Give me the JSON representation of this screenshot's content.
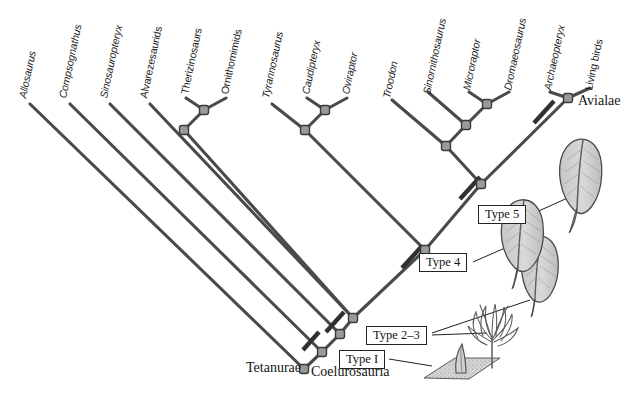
{
  "figure": {
    "type": "cladogram",
    "title_visible": false,
    "colors": {
      "branch": "#4a4a4a",
      "node_fill": "#8d8d8d",
      "node_stroke": "#3a3a3a",
      "tick": "#3a3a3a",
      "text": "#1b1b1b",
      "box_border": "#232323",
      "feather_fill": "#cfcfcf",
      "feather_stroke": "#4a4a4a",
      "ground_fill": "#c9c9c9"
    },
    "tips": [
      {
        "id": "allosaurus",
        "label": "Allosaurus",
        "italic": true,
        "x": 22,
        "y": 92
      },
      {
        "id": "compsognathus",
        "label": "Compsognathus",
        "italic": true,
        "x": 62,
        "y": 92
      },
      {
        "id": "sinosauropteryx",
        "label": "Sinosauropteryx",
        "italic": true,
        "x": 103,
        "y": 92
      },
      {
        "id": "alvarezsaurids",
        "label": "Alvarezesaurids",
        "italic": false,
        "x": 143,
        "y": 92
      },
      {
        "id": "therizinosaurs",
        "label": "Therizinosaurs",
        "italic": false,
        "x": 184,
        "y": 88
      },
      {
        "id": "ornithomimids",
        "label": "Ornithomimids",
        "italic": false,
        "x": 224,
        "y": 88
      },
      {
        "id": "tyrannosaurus",
        "label": "Tyrannosaurus",
        "italic": true,
        "x": 265,
        "y": 92
      },
      {
        "id": "caudipteryx",
        "label": "Caudipteryx",
        "italic": true,
        "x": 305,
        "y": 88
      },
      {
        "id": "oviraptor",
        "label": "Oviraptor",
        "italic": true,
        "x": 345,
        "y": 88
      },
      {
        "id": "troodon",
        "label": "Troodon",
        "italic": true,
        "x": 386,
        "y": 92
      },
      {
        "id": "sinornithosaurus",
        "label": "Sinornithosaurus",
        "italic": true,
        "x": 426,
        "y": 88
      },
      {
        "id": "microraptor",
        "label": "Microraptor",
        "italic": true,
        "x": 466,
        "y": 84
      },
      {
        "id": "dromaeosaurus",
        "label": "Dromaeosaurus",
        "italic": true,
        "x": 507,
        "y": 84
      },
      {
        "id": "archaeopteryx",
        "label": "Archaeopteryx",
        "italic": true,
        "x": 547,
        "y": 84
      },
      {
        "id": "living_birds",
        "label": "Living birds",
        "italic": false,
        "x": 588,
        "y": 84
      }
    ],
    "clade_labels": [
      {
        "id": "avialae",
        "label": "Avialae",
        "x": 560,
        "y": 100
      },
      {
        "id": "tetanurae",
        "label": "Tetanurae",
        "x": 246,
        "y": 364
      },
      {
        "id": "coelurosauria",
        "label": "Coelurosauria",
        "x": 311,
        "y": 368
      }
    ],
    "feather_callouts": [
      {
        "id": "type5",
        "label": "Type 5",
        "box_x": 478,
        "box_y": 205,
        "box_w": 54,
        "box_h": 19
      },
      {
        "id": "type4",
        "label": "Type 4",
        "box_x": 419,
        "box_y": 253,
        "box_w": 54,
        "box_h": 19
      },
      {
        "id": "type2_3",
        "label": "Type 2–3",
        "box_x": 366,
        "box_y": 327,
        "box_w": 66,
        "box_h": 19
      },
      {
        "id": "type1",
        "label": "Type I",
        "box_x": 339,
        "box_y": 350,
        "box_w": 50,
        "box_h": 19
      }
    ],
    "character_ticks": [
      {
        "id": "tick-type1",
        "x": 311,
        "y": 341
      },
      {
        "id": "tick-type2-3",
        "x": 335,
        "y": 322
      },
      {
        "id": "tick-type4",
        "x": 412,
        "y": 257
      },
      {
        "id": "tick-type5",
        "x": 470,
        "y": 188
      },
      {
        "id": "tick-avialae",
        "x": 544,
        "y": 112
      }
    ],
    "internal_nodes": [
      {
        "id": "node-ther-orni",
        "x": 204,
        "y": 110
      },
      {
        "id": "node-alv",
        "x": 184,
        "y": 130
      },
      {
        "id": "node-caud-ovi",
        "x": 325,
        "y": 110
      },
      {
        "id": "node-tyr",
        "x": 305,
        "y": 130
      },
      {
        "id": "node-micro-drom",
        "x": 487,
        "y": 104
      },
      {
        "id": "node-sinorn",
        "x": 466,
        "y": 125
      },
      {
        "id": "node-troodon",
        "x": 446,
        "y": 146
      },
      {
        "id": "node-arch-birds",
        "x": 568,
        "y": 98
      },
      {
        "id": "node-paraves",
        "x": 481,
        "y": 184
      },
      {
        "id": "node-maniraptora",
        "x": 425,
        "y": 250
      },
      {
        "id": "node-coelurosaur",
        "x": 353,
        "y": 318
      },
      {
        "id": "node-compso",
        "x": 340,
        "y": 334
      },
      {
        "id": "node-sino",
        "x": 322,
        "y": 352
      },
      {
        "id": "node-root",
        "x": 304,
        "y": 369
      }
    ],
    "caption": ""
  }
}
